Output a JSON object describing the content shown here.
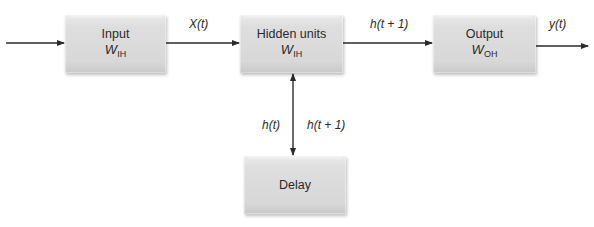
{
  "diagram": {
    "type": "recurrent-neural-network-block-diagram",
    "nodes": [
      {
        "id": "input",
        "label": "Input",
        "weight": "W",
        "weight_sub": "IH"
      },
      {
        "id": "hidden",
        "label": "Hidden units",
        "weight": "W",
        "weight_sub": "IH"
      },
      {
        "id": "output",
        "label": "Output",
        "weight": "W",
        "weight_sub": "OH"
      },
      {
        "id": "delay",
        "label": "Delay"
      }
    ],
    "edges": [
      {
        "from": "external",
        "to": "input",
        "label": ""
      },
      {
        "from": "input",
        "to": "hidden",
        "label": "X(t)"
      },
      {
        "from": "hidden",
        "to": "output",
        "label": "h(t + 1)"
      },
      {
        "from": "output",
        "to": "external",
        "label": "y(t)"
      },
      {
        "from": "hidden",
        "to": "delay",
        "label": "h(t + 1)",
        "bidirectional": true
      },
      {
        "from": "delay",
        "to": "hidden",
        "label": "h(t)"
      }
    ]
  },
  "labels": {
    "x_t": "X(t)",
    "h_t1_top": "h(t + 1)",
    "y_t": "y(t)",
    "h_t": "h(t)",
    "h_t1_side": "h(t + 1)"
  },
  "colors": {
    "box_fill": "#d9d9d9",
    "line": "#2a2a2a",
    "background": "#ffffff"
  }
}
